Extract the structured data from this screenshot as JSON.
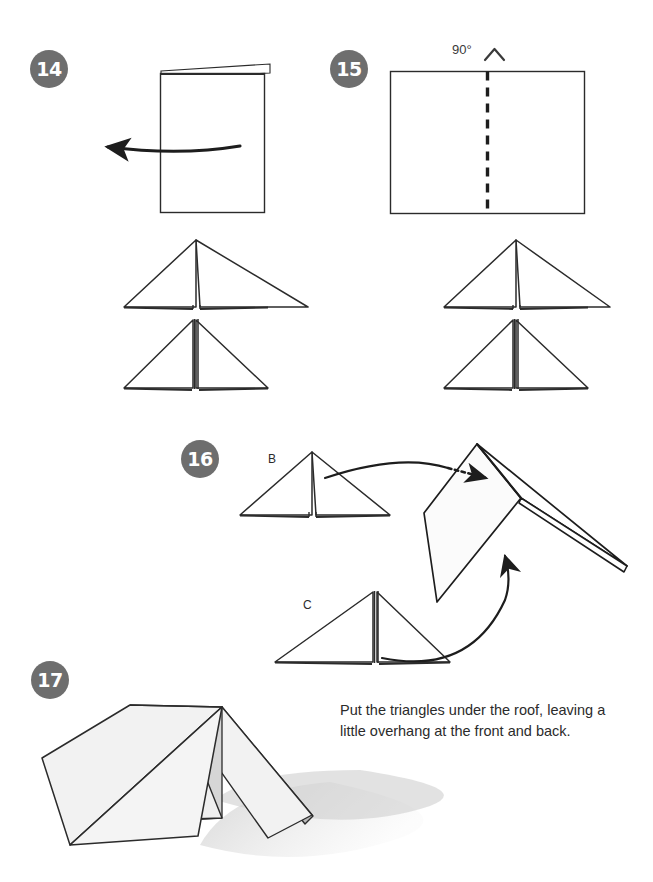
{
  "page": {
    "background_color": "#ffffff"
  },
  "style": {
    "badge_color": "#6e6e6e",
    "badge_text_color": "#ffffff",
    "line_color": "#2b2b2b",
    "paper_fill": "#ffffff",
    "paper_shade_light": "#f0f0f0",
    "paper_shade_mid": "#d9d9d9",
    "paper_shade_dark": "#b8b8b8",
    "shadow_color": "#c9c9c9"
  },
  "steps": [
    {
      "number": "14",
      "badge_name": "step-badge-14",
      "annotations": {
        "arrow": "turn-over-left-arrow"
      }
    },
    {
      "number": "15",
      "badge_name": "step-badge-15",
      "annotations": {
        "angle": "90°",
        "fold_symbol": "mountain-fold-chevron",
        "fold_line": "dashed-vertical-fold"
      }
    },
    {
      "number": "16",
      "badge_name": "step-badge-16",
      "annotations": {
        "triangle_label_upper": "B",
        "triangle_label_lower": "C",
        "arrow_upper": "curved-arrow-to-roof-dotted-tip",
        "arrow_lower": "curved-arrow-up-right"
      },
      "caption": "Put the triangles under the roof, leaving a little overhang at the front and back."
    },
    {
      "number": "17",
      "badge_name": "step-badge-17",
      "annotations": {
        "result": "finished-paper-tent"
      }
    }
  ],
  "labels": {
    "angle_90": "90°",
    "triangle_b": "B",
    "triangle_c": "C"
  },
  "caption": {
    "text": "Put the triangles under the roof, leaving a little overhang at the front and back."
  }
}
